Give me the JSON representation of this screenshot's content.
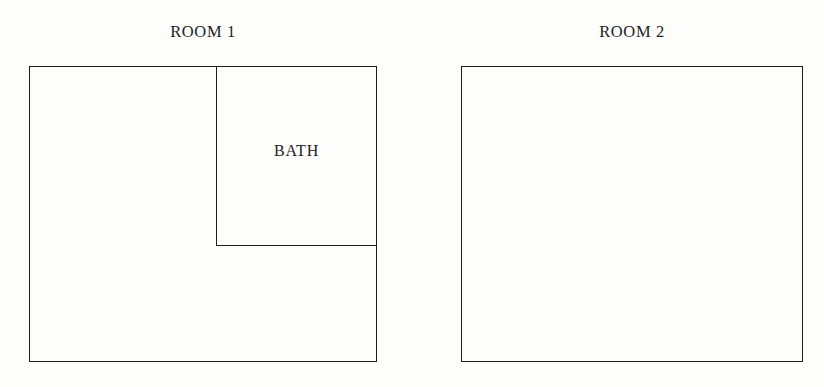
{
  "figure": {
    "background_color": "#fdfdfc",
    "stroke_color": "#1d1d1d",
    "stroke_width": 1.6
  },
  "rooms": [
    {
      "id": "room-1",
      "label": "ROOM 1",
      "outline": {
        "x": 29,
        "y": 66,
        "width": 348,
        "height": 296
      },
      "subregions": [
        {
          "id": "bath",
          "label": "BATH",
          "x": 216,
          "y": 66,
          "width": 161,
          "height": 179,
          "position": "top-right"
        }
      ]
    },
    {
      "id": "room-2",
      "label": "ROOM 2",
      "outline": {
        "x": 461,
        "y": 66,
        "width": 342,
        "height": 296
      },
      "subregions": []
    }
  ],
  "labels": {
    "room1": "ROOM 1",
    "room2": "ROOM 2",
    "bath": "BATH"
  }
}
